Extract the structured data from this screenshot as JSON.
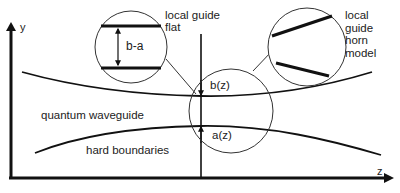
{
  "diagram": {
    "colors": {
      "background": "#ffffff",
      "stroke": "#111111",
      "text": "#222222"
    },
    "axes": {
      "y_label": "y",
      "z_label": "z"
    },
    "labels": {
      "local_guide_flat": "local guide\nflat",
      "local_guide_horn": "local\nguide\nhorn\nmodel",
      "b_minus_a": "b-a",
      "b_z": "b(z)",
      "a_z": "a(z)",
      "quantum_waveguide": "quantum waveguide",
      "hard_boundaries": "hard boundaries"
    },
    "nodes": [
      {
        "id": "flat-inset",
        "shape": "circle",
        "label": "local guide flat",
        "content": "two parallel thick horizontal lines with double arrow labeled b-a"
      },
      {
        "id": "horn-inset",
        "shape": "circle",
        "label": "local guide horn model",
        "content": "two thick slanted lines diverging"
      },
      {
        "id": "focus-region",
        "shape": "circle",
        "label": "",
        "content": "local region of waveguide around z with b(z) and a(z)"
      },
      {
        "id": "upper-boundary",
        "shape": "curve",
        "label": "b(z)"
      },
      {
        "id": "lower-boundary",
        "shape": "curve",
        "label": "a(z)"
      }
    ],
    "edges": [
      {
        "from": "flat-inset",
        "to": "focus-region",
        "style": "thin line"
      },
      {
        "from": "horn-inset",
        "to": "focus-region",
        "style": "thin line"
      }
    ]
  }
}
